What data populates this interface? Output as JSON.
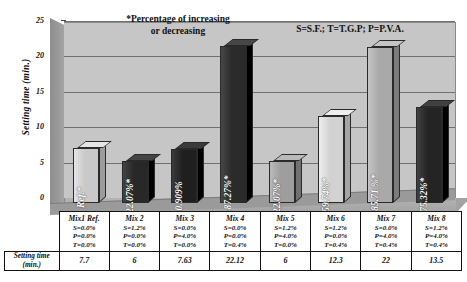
{
  "annotations": {
    "note_percentage": "*Percentage of increasing\nor decreasing",
    "note_percentage_line1": "*Percentage of increasing",
    "note_percentage_line2": "or decreasing",
    "note_legend": "S=S.F.; T=T.G.P; P=P.V.A."
  },
  "axis": {
    "y_title": "Setting time (min.)",
    "y_ticks": [
      "0",
      "5",
      "10",
      "15",
      "20",
      "25"
    ]
  },
  "table": {
    "row_label_line1": "Setting time",
    "row_label_line2": "(min.)",
    "columns": [
      {
        "name": "Mix1 Ref.",
        "s": "S=0.0%",
        "p": "P=0.0%",
        "t": "T=0.0%",
        "value": "7.7"
      },
      {
        "name": "Mix 2",
        "s": "S=1.2%",
        "p": "P=0.0%",
        "t": "T=0.0%",
        "value": "6"
      },
      {
        "name": "Mix 3",
        "s": "S=0.0%",
        "p": "P=4.0%",
        "t": "T=0.0%",
        "value": "7.63"
      },
      {
        "name": "Mix 4",
        "s": "S=0.0%",
        "p": "P=0.0%",
        "t": "T=0.4%",
        "value": "22.12"
      },
      {
        "name": "Mix 5",
        "s": "S=1.2%",
        "p": "P=4.0%",
        "t": "T=0.0%",
        "value": "6"
      },
      {
        "name": "Mix 6",
        "s": "S=1.2%",
        "p": "P=0.0%",
        "t": "T=0.4%",
        "value": "12.3"
      },
      {
        "name": "Mix 7",
        "s": "S=0.0%",
        "p": "P=4.0%",
        "t": "T=0.4%",
        "value": "22"
      },
      {
        "name": "Mix 8",
        "s": "S=1.2%",
        "p": "P=4.0%",
        "t": "T=0.4%",
        "value": "13.5"
      }
    ]
  },
  "chart_data": {
    "type": "bar",
    "title": "",
    "xlabel": "",
    "ylabel": "Setting time (min.)",
    "ylim": [
      0,
      25
    ],
    "yticks": [
      0,
      5,
      10,
      15,
      20,
      25
    ],
    "grid": true,
    "legend": "S=S.F.; T=T.G.P; P=P.V.A.",
    "categories": [
      "Mix1 Ref.",
      "Mix 2",
      "Mix 3",
      "Mix 4",
      "Mix 5",
      "Mix 6",
      "Mix 7",
      "Mix 8"
    ],
    "values": [
      7.7,
      6,
      7.63,
      22.12,
      6,
      12.3,
      22,
      13.5
    ],
    "data_labels": [
      "Ref.*",
      "-22.07%*",
      "-0.909%",
      "+187.27%*",
      "-22.07%*",
      "+59.74%*",
      "+185.71 %*",
      "+75.32%*"
    ],
    "bar_colors": [
      "#c9c9c9",
      "#282828",
      "#1f1f1f",
      "#2b2b2b",
      "#9e9e9e",
      "#d2d2d2",
      "#a9a9a9",
      "#242424"
    ],
    "annotations": [
      "*Percentage of increasing or decreasing",
      "S=S.F.; T=T.G.P; P=P.V.A."
    ]
  }
}
